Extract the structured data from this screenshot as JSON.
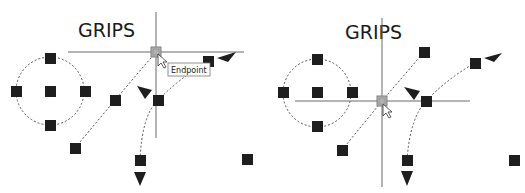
{
  "panels": [
    {
      "id": "before",
      "title": "GRIPS",
      "tooltip": "Endpoint",
      "title_pos": [
        78,
        37
      ],
      "crosshair": {
        "x": 156,
        "y": 52,
        "v": [
          12,
          138
        ],
        "h": [
          68,
          244
        ]
      },
      "selected_grip": [
        156,
        52
      ],
      "circle": {
        "cx": 50,
        "cy": 91,
        "r": 34
      },
      "circle_grips": [
        [
          50,
          58
        ],
        [
          16,
          91
        ],
        [
          50,
          91
        ],
        [
          85,
          91
        ],
        [
          50,
          125
        ]
      ],
      "grips": [
        [
          115,
          100
        ],
        [
          75,
          148
        ],
        [
          158,
          100
        ],
        [
          140,
          160
        ],
        [
          208,
          61
        ],
        [
          247,
          159
        ]
      ],
      "tooltip_box": [
        168,
        63,
        42,
        13
      ]
    },
    {
      "id": "after",
      "title": "GRIPS",
      "title_pos": [
        345,
        39
      ],
      "crosshair": {
        "x": 382,
        "y": 101,
        "v": [
          18,
          187
        ],
        "h": [
          295,
          470
        ]
      },
      "selected_grip": [
        382,
        101
      ],
      "circle": {
        "cx": 317,
        "cy": 93,
        "r": 34
      },
      "circle_grips": [
        [
          317,
          59
        ],
        [
          283,
          92
        ],
        [
          317,
          92
        ],
        [
          352,
          92
        ],
        [
          317,
          126
        ]
      ],
      "grips": [
        [
          424,
          52
        ],
        [
          342,
          150
        ],
        [
          426,
          101
        ],
        [
          407,
          160
        ],
        [
          475,
          63
        ],
        [
          514,
          160
        ]
      ]
    }
  ],
  "colors": {
    "grip": "#1e1e1e",
    "selected_grip": "#b0b0b0",
    "crosshair": "#6a6a6a",
    "dashed": "#555555"
  }
}
